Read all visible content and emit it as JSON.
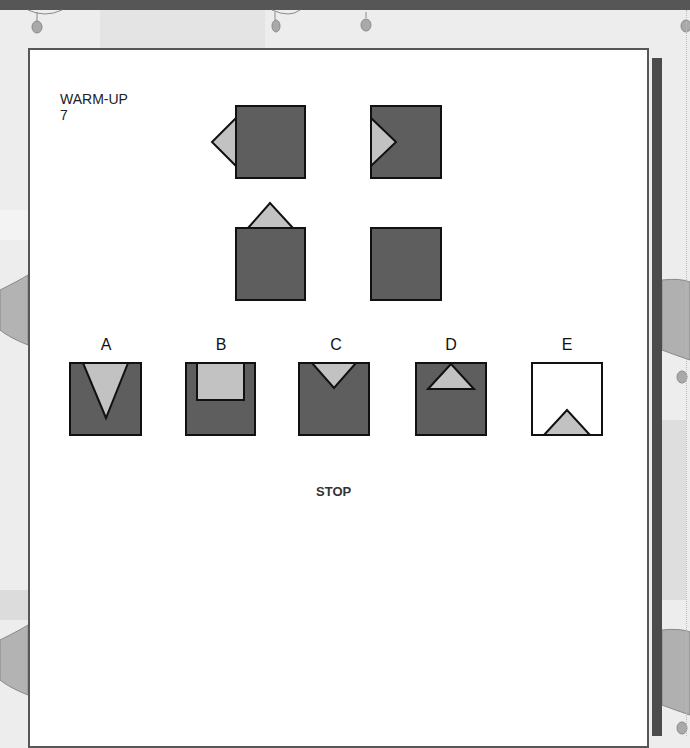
{
  "page": {
    "section_title": "WARM-UP",
    "question_number": "7",
    "stop_label": "STOP"
  },
  "colors": {
    "square_fill": "#5e5e5e",
    "triangle_fill": "#c2c2c2",
    "outline": "#111111",
    "paper": "#ffffff",
    "background": "#ededed",
    "shadow": "#4b4b4b"
  },
  "matrix": {
    "cells": [
      {
        "position": "top-left",
        "description": "dark square with light triangle pointing left outside left edge"
      },
      {
        "position": "top-right",
        "description": "dark square with light triangle pointing right inside left edge"
      },
      {
        "position": "bottom-left",
        "description": "dark square with light triangle pointing up outside top edge"
      },
      {
        "position": "bottom-right",
        "description": "dark square, missing element (answer)"
      }
    ]
  },
  "options": [
    {
      "label": "A",
      "description": "dark square with long light triangle pointing down from top edge"
    },
    {
      "label": "B",
      "description": "dark square with light rectangle inside top edge"
    },
    {
      "label": "C",
      "description": "dark square with small light triangle pointing down inside top edge"
    },
    {
      "label": "D",
      "description": "dark square with light triangle pointing up inside top edge"
    },
    {
      "label": "E",
      "description": "white square with light triangle pointing up inside bottom edge"
    }
  ]
}
